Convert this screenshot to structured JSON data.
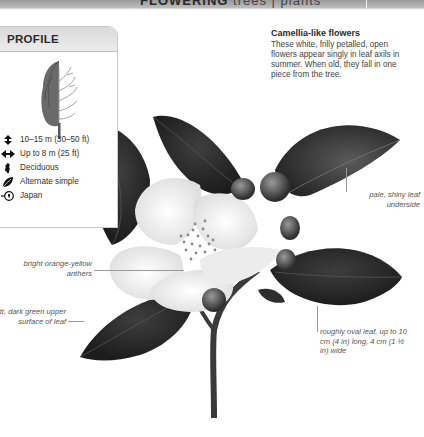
{
  "header": {
    "title_bold": "FLOWERING",
    "title_light": "trees | plants"
  },
  "profile": {
    "heading": "PROFILE",
    "facts": [
      {
        "icon": "height-arrows-icon",
        "text": "10–15 m (30–50 ft)"
      },
      {
        "icon": "width-arrows-icon",
        "text": "Up to 8 m (25 ft)"
      },
      {
        "icon": "deciduous-leaf-icon",
        "text": "Deciduous"
      },
      {
        "icon": "leaf-arrangement-icon",
        "text": "Alternate simple"
      },
      {
        "icon": "globe-icon",
        "text": "Japan"
      }
    ]
  },
  "callout": {
    "title": "Camellia-like flowers",
    "body": "These white, frilly petalled, open flowers appear singly in leaf axils in summer. When old, they fall in one piece from the tree."
  },
  "annotations": {
    "underside": "pale, shiny leaf underside",
    "anthers": "bright orange-yellow anthers",
    "upper_surface": "matt, dark green upper surface of leaf",
    "oval_leaf": "roughly oval leaf, up to 10 cm (4 in) long, 4 cm (1 ½ in) wide"
  },
  "colors": {
    "header_gray": "#a8a8a8",
    "leaf_dark": "#2a2a2a",
    "petal": "#f4f4f4",
    "text": "#3a3a3a"
  }
}
